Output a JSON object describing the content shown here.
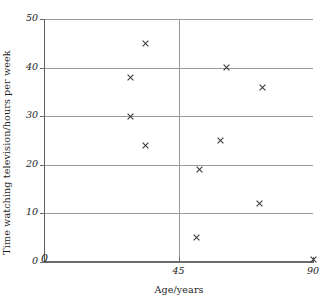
{
  "chart_data": {
    "type": "scatter",
    "title": "",
    "xlabel": "Age/years",
    "ylabel": "Time watching television/hours per week",
    "xlim": [
      0,
      90
    ],
    "ylim": [
      0,
      50
    ],
    "xticks": [
      0,
      45,
      90
    ],
    "xtick_labels": [
      "0",
      "45",
      "90"
    ],
    "yticks": [
      0,
      10,
      20,
      30,
      40,
      50
    ],
    "ytick_labels": [
      "0",
      "10",
      "20",
      "30",
      "40",
      "50"
    ],
    "grid": {
      "horizontal": [
        10,
        20,
        30,
        40,
        50
      ],
      "vertical": [
        45
      ],
      "color": "#9a9a9a"
    },
    "marker": "x",
    "marker_color": "#3a3a3a",
    "legend": null,
    "points": [
      {
        "x": 29,
        "y": 38
      },
      {
        "x": 29,
        "y": 30
      },
      {
        "x": 34,
        "y": 45
      },
      {
        "x": 34,
        "y": 24
      },
      {
        "x": 51,
        "y": 5
      },
      {
        "x": 52,
        "y": 19
      },
      {
        "x": 59,
        "y": 25
      },
      {
        "x": 61,
        "y": 40
      },
      {
        "x": 72,
        "y": 12
      },
      {
        "x": 73,
        "y": 36
      },
      {
        "x": 90,
        "y": 0.5
      }
    ]
  },
  "axes": {
    "y_title": "Time watching television/hours per week",
    "x_title": "Age/years",
    "y_labels": [
      "50",
      "40",
      "30",
      "20",
      "10",
      "0"
    ],
    "x_labels": [
      "0",
      "45",
      "90"
    ]
  }
}
